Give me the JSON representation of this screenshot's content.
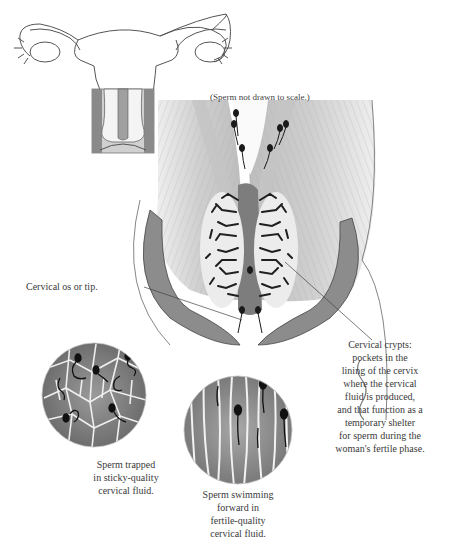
{
  "diagram": {
    "type": "anatomical-illustration"
  },
  "scale_note": "(Sperm not drawn to scale.)",
  "labels": {
    "cervical_os": "Cervical os or tip.",
    "cervical_crypts": [
      "Cervical crypts:",
      "pockets in the",
      "lining of the cervix",
      "where the cervical",
      "fluid is produced,",
      "and that function as a",
      "temporary shelter",
      "for sperm during the",
      "woman's fertile phase."
    ]
  },
  "captions": {
    "sticky": [
      "Sperm trapped",
      "in sticky-quality",
      "cervical fluid."
    ],
    "fertile": [
      "Sperm swimming",
      "forward in",
      "fertile-quality",
      "cervical fluid."
    ]
  },
  "colors": {
    "line": "#555555",
    "tissue_light": "#d8d8d8",
    "tissue_mid": "#9a9a9a",
    "tissue_dark": "#3a3a3a",
    "background": "#ffffff"
  }
}
